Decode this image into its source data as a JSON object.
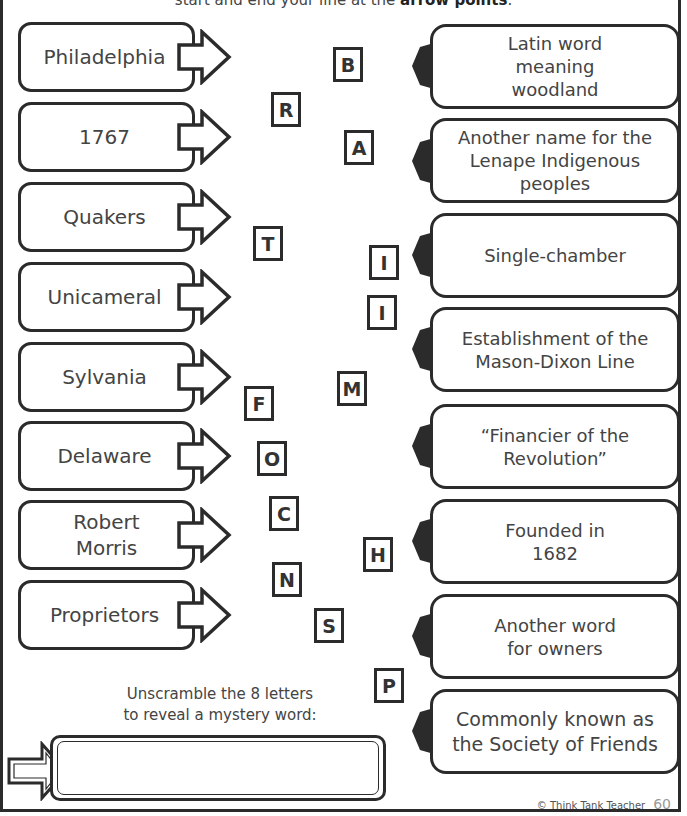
{
  "instructions": {
    "text_prefix": "start and end your line at the ",
    "text_bold": "arrow points",
    "text_suffix": "."
  },
  "terms": [
    {
      "label": "Philadelphia"
    },
    {
      "label": "1767"
    },
    {
      "label": "Quakers"
    },
    {
      "label": "Unicameral"
    },
    {
      "label": "Sylvania"
    },
    {
      "label": "Delaware"
    },
    {
      "label": "Robert Morris"
    },
    {
      "label": "Proprietors"
    }
  ],
  "definitions": [
    {
      "label": "Latin word meaning woodland"
    },
    {
      "label": "Another name for the Lenape Indigenous peoples"
    },
    {
      "label": "Single-chamber"
    },
    {
      "label": "Establishment of the Mason-Dixon Line"
    },
    {
      "label": "“Financier of the Revolution”"
    },
    {
      "label": "Founded in 1682"
    },
    {
      "label": "Another word for owners"
    },
    {
      "label": "Commonly known as the Society of Friends"
    }
  ],
  "letters": [
    {
      "char": "B",
      "x": 333,
      "y": 47
    },
    {
      "char": "R",
      "x": 271,
      "y": 92
    },
    {
      "char": "A",
      "x": 344,
      "y": 130
    },
    {
      "char": "T",
      "x": 253,
      "y": 226
    },
    {
      "char": "I",
      "x": 369,
      "y": 245
    },
    {
      "char": "I",
      "x": 367,
      "y": 295
    },
    {
      "char": "M",
      "x": 337,
      "y": 371
    },
    {
      "char": "F",
      "x": 244,
      "y": 386
    },
    {
      "char": "O",
      "x": 257,
      "y": 441
    },
    {
      "char": "C",
      "x": 269,
      "y": 496
    },
    {
      "char": "H",
      "x": 363,
      "y": 537
    },
    {
      "char": "N",
      "x": 272,
      "y": 562
    },
    {
      "char": "S",
      "x": 314,
      "y": 608
    },
    {
      "char": "P",
      "x": 374,
      "y": 668
    }
  ],
  "unscramble": {
    "line1": "Unscramble the 8 letters",
    "line2": "to reveal a mystery word:",
    "answer_value": ""
  },
  "footer": {
    "copyright": "© Think Tank Teacher",
    "page_number": "60"
  }
}
